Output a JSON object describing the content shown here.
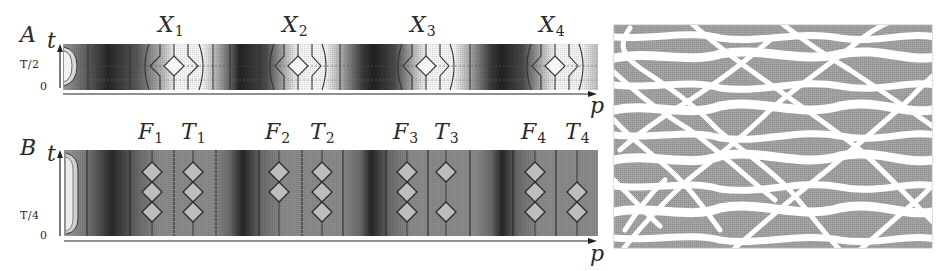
{
  "figure": {
    "panel_a": {
      "letter": "A",
      "t_axis_label": "t",
      "p_axis_label": "p",
      "y_ticks": [
        "T/2",
        "0"
      ],
      "column_labels": [
        {
          "name": "X",
          "sub": "1",
          "x": 174
        },
        {
          "name": "X",
          "sub": "2",
          "x": 298
        },
        {
          "name": "X",
          "sub": "3",
          "x": 426
        },
        {
          "name": "X",
          "sub": "4",
          "x": 555
        }
      ]
    },
    "panel_b": {
      "letter": "B",
      "t_axis_label": "t",
      "p_axis_label": "p",
      "y_ticks": [
        "T/4",
        "0"
      ],
      "column_labels": [
        {
          "name": "F",
          "sub": "1",
          "x": 152,
          "diamonds": 3
        },
        {
          "name": "T",
          "sub": "1",
          "x": 193,
          "diamonds": 3
        },
        {
          "name": "F",
          "sub": "2",
          "x": 279,
          "diamonds": 2
        },
        {
          "name": "T",
          "sub": "2",
          "x": 322,
          "diamonds": 3
        },
        {
          "name": "F",
          "sub": "3",
          "x": 407,
          "diamonds": 3
        },
        {
          "name": "T",
          "sub": "3",
          "x": 446,
          "diamonds": 2
        },
        {
          "name": "F",
          "sub": "4",
          "x": 535,
          "diamonds": 3
        },
        {
          "name": "T",
          "sub": "4",
          "x": 577,
          "diamonds": 2
        }
      ]
    },
    "panel_c": {
      "description": "space-time interference pattern (white crossing trajectories on grey background)"
    },
    "colors": {
      "dark_band": "#1e1e1e",
      "mid_grey": "#8c8c8c",
      "light_grey": "#d8d8d8",
      "pattern_grey": "#9a9a9a",
      "white": "#ffffff",
      "ink": "#2a2a2a"
    }
  }
}
